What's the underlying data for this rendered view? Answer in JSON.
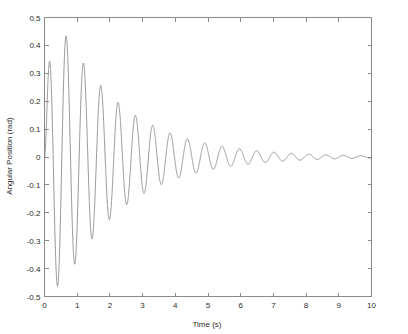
{
  "chart_data": {
    "type": "line",
    "title": "",
    "xlabel": "Time (s)",
    "ylabel": "Angular Position (rad)",
    "xlim": [
      0,
      10
    ],
    "ylim": [
      -0.5,
      0.5
    ],
    "grid": false,
    "legend": null,
    "line_color": "#7d7d7d",
    "background_color": "#ffffff",
    "axis_color": "#8a8a8a",
    "xticks": [
      0,
      1,
      2,
      3,
      4,
      5,
      6,
      7,
      8,
      9,
      10
    ],
    "xtick_labels": [
      "0",
      "1",
      "2",
      "3",
      "4",
      "5",
      "6",
      "7",
      "8",
      "9",
      "10"
    ],
    "yticks": [
      -0.5,
      -0.4,
      -0.3,
      -0.2,
      -0.1,
      0,
      0.1,
      0.2,
      0.3,
      0.4,
      0.5
    ],
    "ytick_labels": [
      "-0.5",
      "-0.4",
      "-0.3",
      "-0.2",
      "-0.1",
      "0",
      "0.1",
      "0.2",
      "0.3",
      "0.4",
      "0.5"
    ],
    "series": [
      {
        "name": "angular position",
        "description": "damped oscillation decaying to zero",
        "model": {
          "form": "A * exp(-t/tau) * sin(omega*t) with smooth start",
          "amplitude": 0.62,
          "tau": 1.95,
          "period": 0.53,
          "omega": 11.855,
          "phase": 0.0,
          "start_ramp": 0.16
        },
        "extrema": [
          {
            "t": 0.22,
            "value": 0.145
          },
          {
            "t": 0.45,
            "value": -0.335
          },
          {
            "t": 0.72,
            "value": 0.435
          },
          {
            "t": 0.99,
            "value": -0.46
          },
          {
            "t": 1.25,
            "value": 0.445
          },
          {
            "t": 1.52,
            "value": -0.4
          },
          {
            "t": 1.78,
            "value": 0.33
          },
          {
            "t": 2.05,
            "value": -0.27
          },
          {
            "t": 2.31,
            "value": 0.208
          },
          {
            "t": 2.58,
            "value": -0.155
          },
          {
            "t": 2.84,
            "value": 0.118
          },
          {
            "t": 3.11,
            "value": -0.098
          },
          {
            "t": 3.37,
            "value": 0.077
          },
          {
            "t": 3.64,
            "value": -0.068
          },
          {
            "t": 3.9,
            "value": 0.072
          },
          {
            "t": 4.17,
            "value": -0.058
          },
          {
            "t": 4.43,
            "value": 0.062
          },
          {
            "t": 4.7,
            "value": -0.048
          },
          {
            "t": 4.96,
            "value": 0.043
          },
          {
            "t": 5.23,
            "value": -0.04
          },
          {
            "t": 5.49,
            "value": 0.038
          },
          {
            "t": 5.76,
            "value": -0.03
          },
          {
            "t": 6.02,
            "value": 0.026
          },
          {
            "t": 6.29,
            "value": -0.022
          },
          {
            "t": 6.55,
            "value": 0.02
          },
          {
            "t": 6.82,
            "value": -0.017
          },
          {
            "t": 7.08,
            "value": 0.015
          },
          {
            "t": 7.35,
            "value": -0.013
          },
          {
            "t": 7.61,
            "value": 0.011
          },
          {
            "t": 7.88,
            "value": -0.009
          },
          {
            "t": 8.14,
            "value": 0.008
          },
          {
            "t": 8.41,
            "value": -0.007
          },
          {
            "t": 8.67,
            "value": 0.006
          },
          {
            "t": 8.94,
            "value": -0.005
          },
          {
            "t": 9.2,
            "value": 0.004
          },
          {
            "t": 9.47,
            "value": -0.003
          },
          {
            "t": 9.73,
            "value": 0.003
          },
          {
            "t": 10.0,
            "value": 0.001
          }
        ]
      }
    ]
  }
}
